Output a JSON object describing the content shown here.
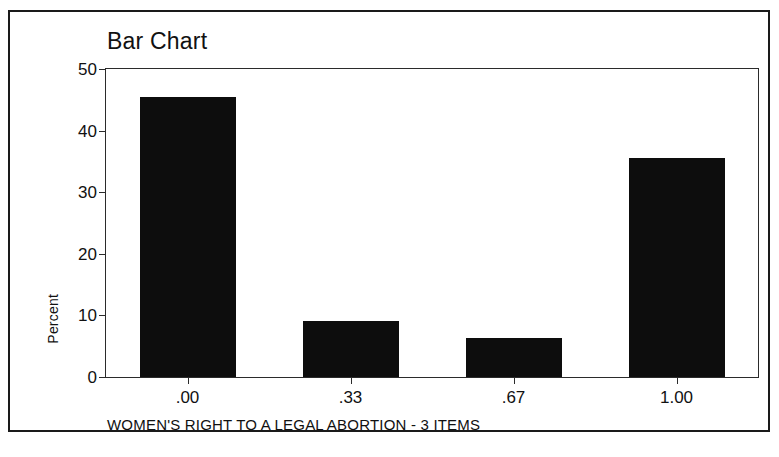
{
  "figure": {
    "title": "Bar Chart",
    "background_color": "#ffffff",
    "border_color": "#1a1a1a",
    "bar_color": "#0d0d0d",
    "axis_color": "#2b2b2b"
  },
  "chart_data": {
    "type": "bar",
    "title": "Bar Chart",
    "categories": [
      ".00",
      ".33",
      ".67",
      "1.00"
    ],
    "values": [
      45.5,
      9.1,
      6.3,
      35.5
    ],
    "xlabel": "WOMEN'S RIGHT TO A LEGAL ABORTION - 3 ITEMS",
    "ylabel": "Percent",
    "ylim": [
      0,
      50
    ],
    "yticks": [
      "0",
      "10",
      "20",
      "30",
      "40",
      "50"
    ],
    "ytick_values": [
      0,
      10,
      20,
      30,
      40,
      50
    ],
    "grid": false,
    "legend": false
  }
}
